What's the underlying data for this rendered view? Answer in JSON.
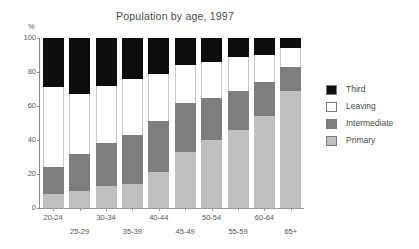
{
  "chart_data": {
    "type": "bar",
    "subtype": "stacked-100",
    "title": "Population by age, 1997",
    "xlabel": "",
    "ylabel": "%",
    "ylim": [
      0,
      100
    ],
    "yticks": [
      0,
      20,
      40,
      60,
      80,
      100
    ],
    "grid": false,
    "legend_position": "right",
    "categories": [
      "20-24",
      "25-29",
      "30-34",
      "35-39",
      "40-44",
      "45-49",
      "50-54",
      "55-59",
      "60-64",
      "65+"
    ],
    "series": [
      {
        "name": "Primary",
        "color": "#bfbfbf",
        "values": [
          8,
          10,
          13,
          14,
          21,
          33,
          40,
          46,
          54,
          69
        ]
      },
      {
        "name": "Intermediate",
        "color": "#7d7d7d",
        "values": [
          16,
          22,
          25,
          29,
          30,
          29,
          25,
          23,
          20,
          14
        ]
      },
      {
        "name": "Leaving",
        "color": "#ffffff",
        "values": [
          47,
          35,
          34,
          33,
          28,
          22,
          21,
          20,
          16,
          11
        ]
      },
      {
        "name": "Third",
        "color": "#0d0d0d",
        "values": [
          29,
          33,
          28,
          24,
          21,
          16,
          14,
          11,
          10,
          6
        ]
      }
    ],
    "cumulative_tops": {
      "primary": [
        8,
        10,
        13,
        14,
        21,
        33,
        40,
        46,
        54,
        69
      ],
      "intermediate": [
        24,
        32,
        38,
        43,
        51,
        62,
        65,
        69,
        74,
        83
      ],
      "leaving": [
        71,
        67,
        72,
        76,
        79,
        84,
        86,
        89,
        90,
        94
      ],
      "third": [
        100,
        100,
        100,
        100,
        100,
        100,
        100,
        100,
        100,
        100
      ]
    }
  },
  "legend": {
    "items": [
      {
        "label": "Third",
        "color": "#0d0d0d"
      },
      {
        "label": "Leaving",
        "color": "#ffffff"
      },
      {
        "label": "Intermediate",
        "color": "#7d7d7d"
      },
      {
        "label": "Primary",
        "color": "#bfbfbf"
      }
    ]
  }
}
